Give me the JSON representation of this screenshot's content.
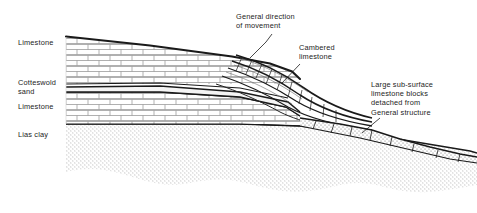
{
  "figure": {
    "width": 477,
    "height": 213,
    "background": "#ffffff",
    "ink_color": "#1a1a1a",
    "text_color": "#232323"
  },
  "strata_labels": {
    "limestone_upper": "Limestone",
    "cotteswold_sand": "Cotteswold\nsand",
    "limestone_lower": "Limestone",
    "lias_clay": "Lias clay"
  },
  "annotations": {
    "general_direction": "General direction\nof movement",
    "cambered_limestone": "Cambered\nlimestone",
    "large_blocks": "Large sub-surface\nlimestone blocks\ndetached from\nGeneral structure"
  },
  "layers": [
    {
      "name": "limestone-upper",
      "fill_pattern": "brick",
      "label": "Limestone",
      "description": "Upper limestone bed drawn with ashlar brick hatching, surface sloping gently down to the right"
    },
    {
      "name": "cotteswold-sand",
      "fill_pattern": "blank-band",
      "label": "Cotteswold sand",
      "description": "Thin pale sand band bounded by two dark lines, between upper and lower limestone"
    },
    {
      "name": "limestone-lower",
      "fill_pattern": "brick",
      "label": "Limestone",
      "description": "Lower limestone bed drawn with ashlar brick hatching"
    },
    {
      "name": "lias-clay",
      "fill_pattern": "stipple",
      "label": "Lias clay",
      "description": "Basal clay unit drawn with fine stipple dots, irregular wavy lower boundary"
    }
  ]
}
